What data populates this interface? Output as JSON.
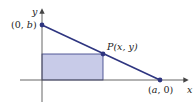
{
  "diagram": {
    "axes": {
      "x_label": "x",
      "y_label": "y"
    },
    "points": {
      "y_intercept": {
        "label_open": "(0, ",
        "label_var": "b",
        "label_close": ")"
      },
      "p": {
        "label_p": "P",
        "label_coords": "(x, y)"
      },
      "x_intercept": {
        "label_open": "(",
        "label_var": "a",
        "label_close": ", 0)"
      }
    },
    "colors": {
      "line": "#2e3580",
      "rect_fill": "#c8cbe8",
      "axis": "#555555"
    }
  }
}
